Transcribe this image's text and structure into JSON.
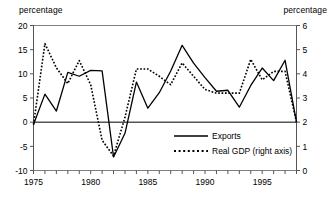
{
  "captions": {
    "left": "percentage",
    "right": "percentage"
  },
  "chart_data": {
    "type": "line",
    "title": "",
    "subtitle": "",
    "xlabel": "",
    "ylabel": "percentage",
    "y2label": "percentage",
    "grid": false,
    "legend_position": "center-right-inside",
    "xlim": [
      1975,
      1998
    ],
    "ylim": [
      -10,
      20
    ],
    "y2lim": [
      0,
      6
    ],
    "yticks": [
      20,
      15,
      10,
      5,
      0,
      -5,
      -10
    ],
    "y2ticks": [
      6,
      5,
      4,
      3,
      2,
      1,
      0
    ],
    "xticks": [
      1975,
      1980,
      1985,
      1990,
      1995
    ],
    "xtick_minor_every": 1,
    "x": [
      1975,
      1976,
      1977,
      1978,
      1979,
      1980,
      1981,
      1982,
      1983,
      1984,
      1985,
      1986,
      1987,
      1988,
      1989,
      1990,
      1991,
      1992,
      1993,
      1994,
      1995,
      1996,
      1997,
      1998
    ],
    "series": [
      {
        "name": "Exports",
        "axis": "left",
        "style": "solid",
        "color": "#000000",
        "values": [
          -0.5,
          5.8,
          2.3,
          10.3,
          9.5,
          10.7,
          10.6,
          -7.2,
          -2.3,
          8.3,
          2.9,
          6.1,
          10.6,
          15.9,
          12.2,
          9.2,
          6.4,
          6.6,
          3.1,
          7.6,
          11.2,
          8.6,
          12.8,
          0.0
        ]
      },
      {
        "name": "Real GDP (right axis)",
        "axis": "right",
        "style": "dotted",
        "color": "#000000",
        "values": [
          1.9,
          5.25,
          4.25,
          3.6,
          4.55,
          3.55,
          1.25,
          0.6,
          2.2,
          4.2,
          4.2,
          3.9,
          3.55,
          4.45,
          3.9,
          3.35,
          3.2,
          3.2,
          3.2,
          4.6,
          3.75,
          4.1,
          4.1,
          2.0
        ]
      }
    ],
    "legend": [
      {
        "label": "Exports",
        "style": "solid"
      },
      {
        "label": "Real GDP (right axis)",
        "style": "dotted"
      }
    ]
  }
}
